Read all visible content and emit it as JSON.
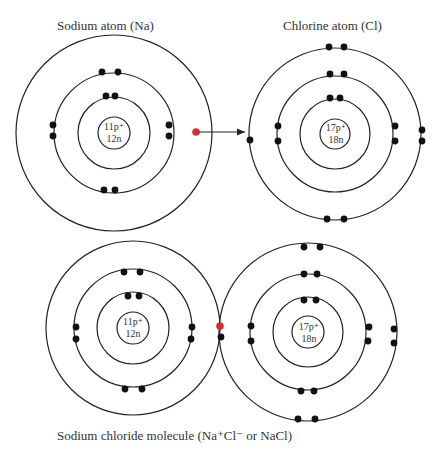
{
  "labels": {
    "sodium_atom": "Sodium atom (Na)",
    "chlorine_atom": "Chlorine atom (Cl)",
    "molecule": "Sodium chloride molecule (Na⁺Cl⁻ or NaCl)"
  },
  "nuclei": {
    "sodium": {
      "protons": "11p⁺",
      "neutrons": "12n"
    },
    "chlorine": {
      "protons": "17p⁺",
      "neutrons": "18n"
    }
  },
  "colors": {
    "shell": "#222222",
    "electron": "#111111",
    "transferred_electron": "#d32f2f",
    "text": "#333333"
  },
  "atoms": {
    "sodium": {
      "shells": [
        2,
        8,
        1
      ]
    },
    "chlorine": {
      "shells": [
        2,
        8,
        7
      ]
    }
  }
}
